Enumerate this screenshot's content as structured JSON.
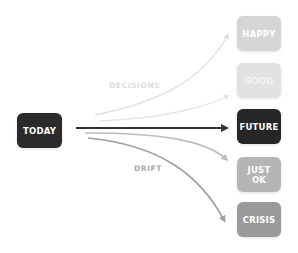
{
  "diagram": {
    "source": {
      "label": "TODAY",
      "color": "#2b2b2b"
    },
    "outcomes": [
      {
        "id": "happy",
        "label": "HAPPY",
        "color": "#d6d6d6",
        "text_color": "#ffffff"
      },
      {
        "id": "good",
        "label": "GOOD",
        "color": "#e2e2e2",
        "text_color": "#f4f4f4"
      },
      {
        "id": "future",
        "label": "FUTURE",
        "color": "#262626",
        "text_color": "#ffffff"
      },
      {
        "id": "just-ok",
        "label": "JUST\nOK",
        "line1": "JUST",
        "line2": "OK",
        "color": "#b5b5b5",
        "text_color": "#ffffff"
      },
      {
        "id": "crisis",
        "label": "CRISIS",
        "color": "#9a9a9a",
        "text_color": "#ffffff"
      }
    ],
    "edge_labels": {
      "decisions": "DECISIONS",
      "drift": "DRIFT"
    },
    "arrow_colors": {
      "happy": "#e0e0e0",
      "good": "#e6e6e6",
      "future": "#333333",
      "just_ok": "#bdbdbd",
      "crisis": "#9e9e9e"
    }
  }
}
